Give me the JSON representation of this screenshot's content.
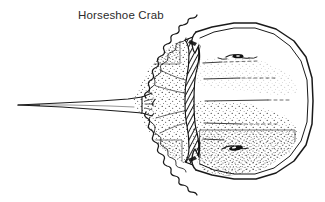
{
  "figure": {
    "caption": "Horseshoe Crab",
    "caption_color": "#2b2b2b",
    "background_color": "#ffffff",
    "ink_color": "#1a1a1a",
    "illustration_name": "horseshoe-crab-line-drawing",
    "style": "black-and-white pen-and-ink stipple line art",
    "orientation": "dorsal view, head (prosoma) to the right, telson to the left",
    "parts": [
      {
        "name": "prosoma",
        "label": "carapace",
        "description": "large crescent-shaped head shield on the right with double outline rim"
      },
      {
        "name": "opisthosoma",
        "label": "abdomen",
        "description": "stippled triangular mid-body with serrated spine margins"
      },
      {
        "name": "hinge",
        "label": "hinge",
        "description": "dark cross-hatched vertical band joining carapace and abdomen"
      },
      {
        "name": "telson",
        "label": "tail spine",
        "description": "long thin tapering spike extending to the left"
      },
      {
        "name": "compound-eye-upper",
        "label": "compound eye",
        "description": "small dark lens shape on upper carapace"
      },
      {
        "name": "compound-eye-lower",
        "label": "compound eye",
        "description": "small dark lens shape on lower carapace"
      }
    ]
  }
}
